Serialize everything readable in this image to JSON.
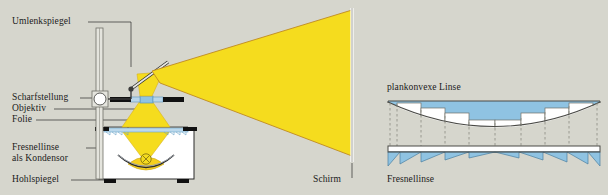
{
  "figure": {
    "background_color": "#d6d6cd",
    "beam_color": "#f5dc1e",
    "beam_edge_color": "#c08a20",
    "glass_color": "#7fb8dc",
    "ink_color": "#1a1a1a",
    "white_color": "#ffffff"
  },
  "left_diagram": {
    "name": "overhead-projector-schematic",
    "labels": {
      "deflecting_mirror": "Umlenkspiegel",
      "focus_adjust": "Scharfstellung",
      "objective": "Objektiv",
      "transparency": "Folie",
      "fresnel_condenser_line1": "Fresnellinse",
      "fresnel_condenser_line2": "als Kondensor",
      "concave_mirror": "Hohlspiegel",
      "screen": "Schirm"
    }
  },
  "right_diagram": {
    "name": "fresnel-lens-comparison",
    "labels": {
      "planoconvex_lens": "plankonvexe Linse",
      "fresnel_lens": "Fresnellinse"
    }
  }
}
